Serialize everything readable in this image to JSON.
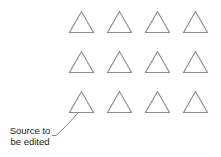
{
  "diagram": {
    "grid": {
      "rows": 3,
      "cols": 4
    },
    "triangle_color": "#8a8a8a",
    "annotation": {
      "line1": "Source to",
      "line2": "be edited",
      "target": {
        "row": 3,
        "col": 1
      }
    }
  }
}
